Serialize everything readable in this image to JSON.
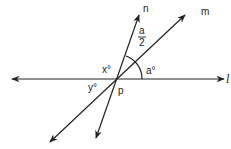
{
  "diagram": {
    "lines": [
      {
        "id": "l",
        "label": "l",
        "description": "horizontal line through p"
      },
      {
        "id": "m",
        "label": "m",
        "description": "line through p rising to upper right"
      },
      {
        "id": "n",
        "label": "n",
        "description": "steeper line through p rising to upper right"
      }
    ],
    "point": {
      "label": "p"
    },
    "angles": {
      "x": "x°",
      "y": "y°",
      "a": "a°",
      "half_a_numerator": "a",
      "half_a_denominator": "2"
    }
  }
}
